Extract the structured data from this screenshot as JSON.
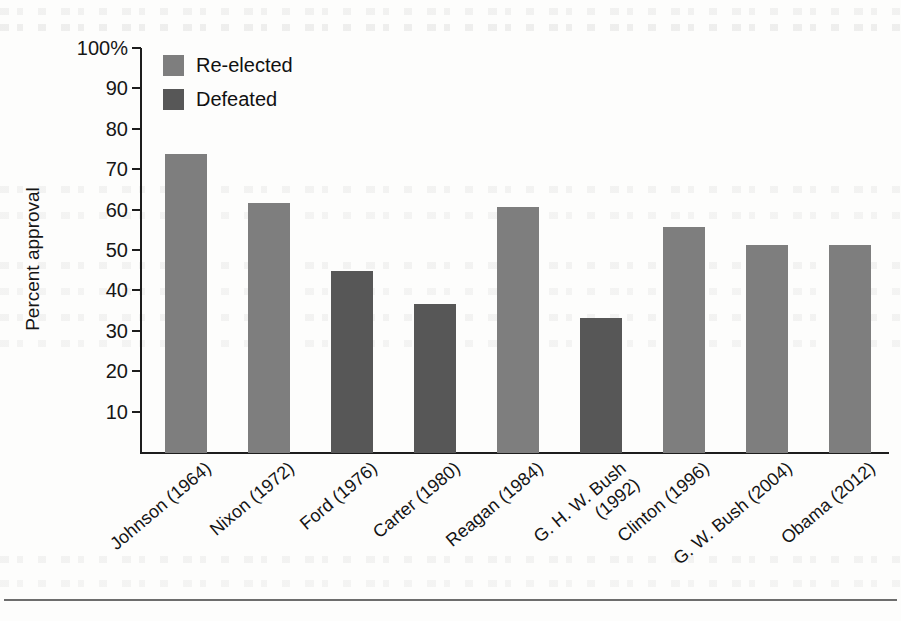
{
  "chart_data": {
    "type": "bar",
    "title": "",
    "xlabel": "",
    "ylabel": "Percent approval",
    "ylim": [
      0,
      100
    ],
    "grid": false,
    "legend_position": "top-left",
    "categories": [
      "Johnson (1964)",
      "Nixon (1972)",
      "Ford (1976)",
      "Carter (1980)",
      "Reagan (1984)",
      "G. H. W. Bush (1992)",
      "Clinton (1996)",
      "G. W. Bush (2004)",
      "Obama (2012)"
    ],
    "values": [
      74,
      62,
      45,
      37,
      61,
      33.5,
      56,
      51.5,
      51.5
    ],
    "point_groups": [
      "Re-elected",
      "Re-elected",
      "Defeated",
      "Defeated",
      "Re-elected",
      "Defeated",
      "Re-elected",
      "Re-elected",
      "Re-elected"
    ],
    "ytick_labels": [
      "100%",
      "90",
      "80",
      "70",
      "60",
      "50",
      "40",
      "30",
      "20",
      "10"
    ],
    "ytick_values": [
      100,
      90,
      80,
      70,
      60,
      50,
      40,
      30,
      20,
      10
    ],
    "legend": [
      {
        "label": "Re-elected",
        "color": "#7e7e7e"
      },
      {
        "label": "Defeated",
        "color": "#575757"
      }
    ]
  },
  "xlabels": [
    {
      "line1": "Johnson (1964)",
      "line2": ""
    },
    {
      "line1": "Nixon (1972)",
      "line2": ""
    },
    {
      "line1": "Ford (1976)",
      "line2": ""
    },
    {
      "line1": "Carter (1980)",
      "line2": ""
    },
    {
      "line1": "Reagan (1984)",
      "line2": ""
    },
    {
      "line1": "G. H. W. Bush",
      "line2": "(1992)"
    },
    {
      "line1": "Clinton (1996)",
      "line2": ""
    },
    {
      "line1": "G. W. Bush (2004)",
      "line2": ""
    },
    {
      "line1": "Obama (2012)",
      "line2": ""
    }
  ],
  "colors": {
    "reelected": "#7e7e7e",
    "defeated": "#575757",
    "axis": "#1d1d1d",
    "page": "#fdfdfc"
  }
}
